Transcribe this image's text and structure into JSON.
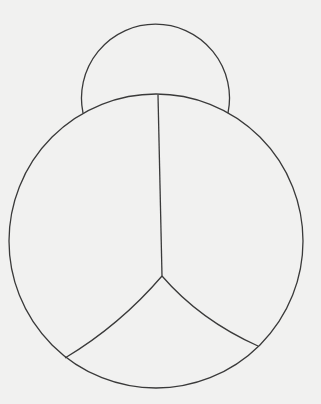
{
  "drawing": {
    "subject": "ladybug outline",
    "background_color": "#f1f1f0",
    "stroke_color": "#3a3a3a",
    "parts": [
      "head",
      "body",
      "wing-divider",
      "lower-segment-left",
      "lower-segment-right"
    ]
  }
}
